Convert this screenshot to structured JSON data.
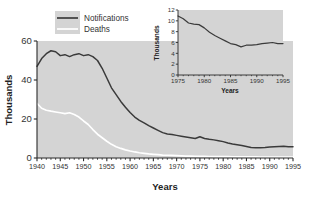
{
  "chart_data": {
    "type": "line",
    "title": "",
    "xlabel": "Years",
    "ylabel": "Thousands",
    "xlim": [
      1940,
      1995
    ],
    "ylim": [
      0,
      60
    ],
    "xticks": [
      1940,
      1945,
      1950,
      1955,
      1960,
      1965,
      1970,
      1975,
      1980,
      1985,
      1990,
      1995
    ],
    "yticks": [
      0,
      20,
      40,
      60
    ],
    "grid": false,
    "legend_position": "top-left",
    "series": [
      {
        "name": "Notifications",
        "color": "#3a3a3a",
        "x": [
          1940,
          1941,
          1942,
          1943,
          1944,
          1945,
          1946,
          1947,
          1948,
          1949,
          1950,
          1951,
          1952,
          1953,
          1954,
          1955,
          1956,
          1957,
          1958,
          1959,
          1960,
          1961,
          1962,
          1963,
          1964,
          1965,
          1966,
          1967,
          1968,
          1969,
          1970,
          1971,
          1972,
          1973,
          1974,
          1975,
          1976,
          1977,
          1978,
          1979,
          1980,
          1981,
          1982,
          1983,
          1984,
          1985,
          1986,
          1987,
          1988,
          1989,
          1990,
          1991,
          1992,
          1993,
          1994,
          1995
        ],
        "values": [
          47.0,
          51.0,
          53.5,
          55.0,
          54.5,
          52.5,
          53.0,
          52.0,
          53.0,
          53.5,
          52.5,
          53.0,
          52.0,
          50.0,
          46.0,
          41.0,
          36.0,
          32.5,
          29.0,
          26.0,
          23.3,
          21.0,
          19.3,
          18.0,
          16.6,
          15.4,
          14.2,
          13.0,
          12.3,
          12.0,
          11.6,
          11.2,
          10.8,
          10.4,
          10.0,
          10.9,
          10.0,
          9.6,
          9.3,
          8.9,
          8.4,
          7.7,
          7.2,
          6.8,
          6.4,
          5.9,
          5.4,
          5.2,
          5.3,
          5.4,
          5.6,
          5.8,
          5.9,
          6.0,
          5.8,
          5.8
        ]
      },
      {
        "name": "Deaths",
        "color": "#ffffff",
        "x": [
          1940,
          1941,
          1942,
          1943,
          1944,
          1945,
          1946,
          1947,
          1948,
          1949,
          1950,
          1951,
          1952,
          1953,
          1954,
          1955,
          1956,
          1957,
          1958,
          1959,
          1960,
          1961,
          1962,
          1963,
          1964,
          1965,
          1966,
          1967,
          1968,
          1969,
          1970,
          1971,
          1972,
          1973,
          1974,
          1975,
          1976,
          1977,
          1978,
          1979,
          1980,
          1981,
          1982,
          1983,
          1984,
          1985,
          1986,
          1987,
          1988,
          1989,
          1990,
          1991,
          1992,
          1993,
          1994,
          1995
        ],
        "values": [
          28.0,
          25.5,
          24.5,
          24.0,
          23.6,
          23.2,
          22.8,
          23.2,
          22.3,
          21.0,
          19.0,
          17.2,
          14.6,
          12.2,
          10.4,
          8.6,
          7.0,
          5.8,
          4.9,
          4.2,
          3.6,
          3.1,
          2.7,
          2.4,
          2.1,
          1.9,
          1.7,
          1.5,
          1.4,
          1.3,
          1.2,
          1.1,
          1.0,
          0.95,
          0.9,
          0.85,
          0.8,
          0.78,
          0.75,
          0.72,
          0.7,
          0.68,
          0.65,
          0.62,
          0.6,
          0.58,
          0.55,
          0.53,
          0.5,
          0.48,
          0.46,
          0.45,
          0.44,
          0.43,
          0.42,
          0.4
        ]
      }
    ],
    "legend": [
      {
        "label": "Notifications",
        "color": "#3a3a3a"
      },
      {
        "label": "Deaths",
        "color": "#ffffff"
      }
    ],
    "inset": {
      "type": "line",
      "xlabel": "Years",
      "ylabel": "Thousands",
      "xlim": [
        1975,
        1995
      ],
      "ylim": [
        0,
        12
      ],
      "xticks": [
        1975,
        1980,
        1985,
        1990,
        1995
      ],
      "yticks": [
        0,
        2,
        4,
        6,
        8,
        10,
        12
      ],
      "grid": false,
      "series": [
        {
          "name": "Notifications",
          "color": "#3a3a3a",
          "x": [
            1975,
            1976,
            1977,
            1978,
            1979,
            1980,
            1981,
            1982,
            1983,
            1984,
            1985,
            1986,
            1987,
            1988,
            1989,
            1990,
            1991,
            1992,
            1993,
            1994,
            1995
          ],
          "values": [
            10.9,
            10.4,
            9.6,
            9.4,
            9.3,
            8.7,
            7.9,
            7.3,
            6.8,
            6.3,
            5.8,
            5.6,
            5.2,
            5.5,
            5.5,
            5.6,
            5.8,
            5.9,
            6.0,
            5.8,
            5.8
          ]
        }
      ]
    },
    "colors": {
      "plot_background": "#d4d4d4",
      "figure_background": "#ffffff",
      "axis": "#2b2b2b",
      "notifications": "#3a3a3a",
      "deaths": "#ffffff"
    }
  }
}
